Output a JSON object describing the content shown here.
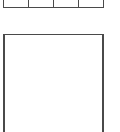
{
  "grid_strip": {
    "cells": [
      {
        "label": ""
      },
      {
        "label": ""
      },
      {
        "label": ""
      },
      {
        "label": ""
      }
    ]
  },
  "panel": {
    "content": ""
  },
  "colors": {
    "stroke": "#4a4a4a",
    "background": "#ffffff"
  }
}
